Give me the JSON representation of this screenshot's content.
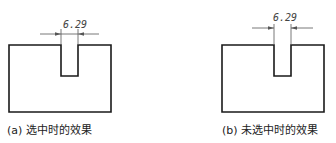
{
  "figures": [
    {
      "id": "a",
      "caption": "(a) 选中时的效果",
      "dimension_value": "6.29",
      "state": "selected"
    },
    {
      "id": "b",
      "caption": "(b) 未选中时的效果",
      "dimension_value": "6.29",
      "state": "unselected"
    }
  ],
  "colors": {
    "outline": "#1a1a1a",
    "dimension": "#555555",
    "text": "#222222"
  }
}
